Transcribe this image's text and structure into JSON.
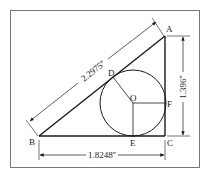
{
  "diagram": {
    "type": "geometry-inscribed-circle-right-triangle",
    "points": {
      "A": "A",
      "B": "B",
      "C": "C",
      "D": "D",
      "E": "E",
      "F": "F",
      "O": "O"
    },
    "dimensions": {
      "hypotenuse": "2.2975''",
      "height": "1.396''",
      "base": "1.8248''"
    },
    "colors": {
      "ink": "#1a1a1a",
      "frame": "#555555",
      "background": "#ffffff"
    }
  }
}
